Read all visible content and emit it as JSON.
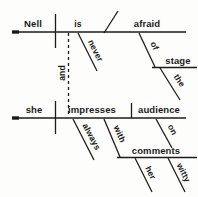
{
  "diagram": {
    "type": "reed-kellogg-sentence-diagram",
    "sentence": "Nell is never afraid of the stage, and she always impresses her audience with witty comments.",
    "ink_color": "#1b1b1b",
    "background_color": "#fdfdfb",
    "clauses": [
      {
        "id": "clause-1",
        "subject": "Nell",
        "verb": "is",
        "predicate_adjective": "afraid",
        "modifiers": [
          {
            "word": "never",
            "attaches_to": "is",
            "slant": "diagonal"
          },
          {
            "word": "of",
            "attaches_to": "afraid",
            "slant": "diagonal"
          },
          {
            "word": "stage",
            "attaches_to": "of",
            "slant": "horizontal"
          },
          {
            "word": "the",
            "attaches_to": "stage",
            "slant": "diagonal"
          }
        ]
      },
      {
        "id": "clause-2",
        "subject": "she",
        "verb": "impresses",
        "direct_object": "audience",
        "modifiers": [
          {
            "word": "always",
            "attaches_to": "impresses",
            "slant": "diagonal"
          },
          {
            "word": "with",
            "attaches_to": "impresses",
            "slant": "diagonal"
          },
          {
            "word": "comments",
            "attaches_to": "with",
            "slant": "horizontal"
          },
          {
            "word": "her",
            "attaches_to": "comments",
            "slant": "diagonal"
          },
          {
            "word": "witty",
            "attaches_to": "comments",
            "slant": "diagonal"
          },
          {
            "word": "on",
            "attaches_to": "audience",
            "slant": "diagonal"
          }
        ]
      }
    ],
    "conjunction": {
      "word": "and",
      "style": "dashed-vertical-connector"
    },
    "words": {
      "nell": "Nell",
      "is": "is",
      "afraid": "afraid",
      "never": "never",
      "of": "of",
      "stage": "stage",
      "the": "the",
      "and": "and",
      "she": "she",
      "impresses": "impresses",
      "audience": "audience",
      "always": "always",
      "with": "with",
      "comments": "comments",
      "her": "her",
      "witty": "witty",
      "on": "on"
    }
  }
}
